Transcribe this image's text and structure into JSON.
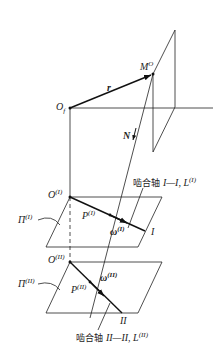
{
  "diagram": {
    "points": {
      "origin_f": {
        "label": "O",
        "sub": "f"
      },
      "point_M": {
        "label": "M",
        "sup": "O"
      },
      "origin_I": {
        "label": "O",
        "sup": "(I)"
      },
      "origin_II": {
        "label": "O",
        "sup": "(II)"
      },
      "point_P_I": {
        "label": "P",
        "sup": "(I)"
      },
      "point_P_II": {
        "label": "P",
        "sup": "(II)"
      }
    },
    "vectors": {
      "r": "r",
      "N": "N",
      "omega_I": {
        "label": "ω",
        "sup": "(I)"
      },
      "omega_II": {
        "label": "ω",
        "sup": "(II)"
      }
    },
    "planes": {
      "plane_I": {
        "label": "Π",
        "sup": "(I)"
      },
      "plane_II": {
        "label": "Π",
        "sup": "(II)"
      }
    },
    "axes": {
      "axis_I_end": "I",
      "axis_II_end": "II",
      "axis_I_caption": {
        "prefix": "啮合轴 ",
        "name": "I—I, L",
        "sup": "(I)"
      },
      "axis_II_caption": {
        "prefix": "啮合轴 ",
        "name": "II—II, L",
        "sup": "(II)"
      }
    }
  }
}
